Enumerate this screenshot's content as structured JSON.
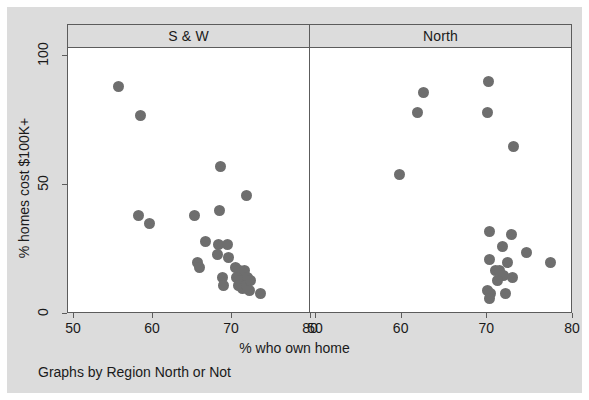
{
  "chart_data": {
    "type": "scatter",
    "title": "",
    "xlabel": "% who own home",
    "ylabel": "% homes cost $100K+",
    "note": "Graphs by Region North or Not",
    "grid": false,
    "legend": "none",
    "marker_color": "#6e6e6e",
    "background_color": "#dcdcdc",
    "panel_background_color": "#ffffff",
    "axis_color": "#5c5c5c",
    "ylim": [
      0,
      100
    ],
    "yticks": [
      0,
      50,
      100
    ],
    "panels": [
      {
        "label": "S & W",
        "xlim": [
          50,
          80
        ],
        "xticks": [
          50,
          60,
          70,
          80
        ],
        "points": [
          {
            "x": 55.6,
            "y": 88
          },
          {
            "x": 58.4,
            "y": 77
          },
          {
            "x": 68.6,
            "y": 57
          },
          {
            "x": 71.8,
            "y": 46
          },
          {
            "x": 58.2,
            "y": 38
          },
          {
            "x": 59.6,
            "y": 35
          },
          {
            "x": 65.2,
            "y": 38
          },
          {
            "x": 68.4,
            "y": 40
          },
          {
            "x": 66.6,
            "y": 28
          },
          {
            "x": 68.3,
            "y": 27
          },
          {
            "x": 69.4,
            "y": 27
          },
          {
            "x": 68.2,
            "y": 23
          },
          {
            "x": 69.6,
            "y": 22
          },
          {
            "x": 65.6,
            "y": 20
          },
          {
            "x": 65.9,
            "y": 18
          },
          {
            "x": 68.8,
            "y": 14
          },
          {
            "x": 68.9,
            "y": 11
          },
          {
            "x": 70.4,
            "y": 18
          },
          {
            "x": 70.9,
            "y": 17
          },
          {
            "x": 71.2,
            "y": 16
          },
          {
            "x": 71.6,
            "y": 17
          },
          {
            "x": 70.6,
            "y": 14
          },
          {
            "x": 71.1,
            "y": 13
          },
          {
            "x": 71.5,
            "y": 13
          },
          {
            "x": 71.9,
            "y": 14
          },
          {
            "x": 70.8,
            "y": 11
          },
          {
            "x": 71.3,
            "y": 10
          },
          {
            "x": 71.8,
            "y": 11
          },
          {
            "x": 72.4,
            "y": 13
          },
          {
            "x": 72.2,
            "y": 9
          },
          {
            "x": 73.6,
            "y": 8
          }
        ]
      },
      {
        "label": "North",
        "xlim": [
          50,
          80
        ],
        "xticks": [
          50,
          60,
          70,
          80
        ],
        "points": [
          {
            "x": 70.1,
            "y": 90
          },
          {
            "x": 62.5,
            "y": 86
          },
          {
            "x": 61.8,
            "y": 78
          },
          {
            "x": 70.0,
            "y": 78
          },
          {
            "x": 73.0,
            "y": 65
          },
          {
            "x": 59.8,
            "y": 54
          },
          {
            "x": 70.3,
            "y": 32
          },
          {
            "x": 72.8,
            "y": 31
          },
          {
            "x": 71.8,
            "y": 26
          },
          {
            "x": 70.2,
            "y": 21
          },
          {
            "x": 74.6,
            "y": 24
          },
          {
            "x": 72.3,
            "y": 20
          },
          {
            "x": 77.4,
            "y": 20
          },
          {
            "x": 71.0,
            "y": 17
          },
          {
            "x": 71.4,
            "y": 17
          },
          {
            "x": 71.9,
            "y": 15
          },
          {
            "x": 71.2,
            "y": 13
          },
          {
            "x": 72.9,
            "y": 14
          },
          {
            "x": 70.0,
            "y": 9
          },
          {
            "x": 70.4,
            "y": 8
          },
          {
            "x": 70.2,
            "y": 6
          },
          {
            "x": 72.1,
            "y": 8
          }
        ]
      }
    ]
  }
}
